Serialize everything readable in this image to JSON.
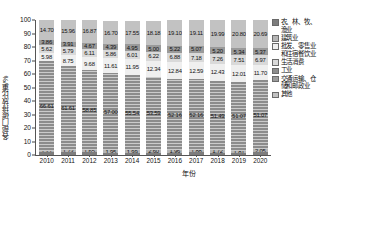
{
  "chart": {
    "type": "bar",
    "y_axis_title": "各部门碳排放比重/%",
    "x_axis_title": "年份",
    "y_ticks": [
      "0",
      "10",
      "20",
      "30",
      "40",
      "50",
      "60",
      "70",
      "80",
      "90",
      "100"
    ]
  },
  "legend": {
    "items": [
      {
        "label": "农、林、牧、\n渔业",
        "color": "#7d7d7d",
        "key": "agriculture"
      },
      {
        "label": "建筑业",
        "color": "#b5b5b5",
        "key": "construction"
      },
      {
        "label": "批发、零售业\n和住宿餐饮业",
        "color": "#efefef",
        "key": "wholesale"
      },
      {
        "label": "生活消费",
        "color": "#d9d9d9",
        "key": "living"
      },
      {
        "label": "工业",
        "color": "#8c8c8c",
        "key": "industry"
      },
      {
        "label": "交通运输、仓\n储和邮政业",
        "color": "#9a9a9a",
        "key": "transport"
      },
      {
        "label": "其他",
        "color": "#c2c2c2",
        "key": "other"
      }
    ]
  },
  "chart_data": {
    "type": "bar",
    "subtype": "stacked-bar-100",
    "title": "",
    "xlabel": "年份",
    "ylabel": "各部门碳排放比重/%",
    "ylim": [
      0,
      100
    ],
    "yticks": [
      0,
      10,
      20,
      30,
      40,
      50,
      60,
      70,
      80,
      90,
      100
    ],
    "grid": false,
    "legend_position": "right",
    "categories": [
      "2010",
      "2011",
      "2012",
      "2013",
      "2014",
      "2015",
      "2016",
      "2017",
      "2018",
      "2019",
      "2020"
    ],
    "series": [
      {
        "name": "农、林、牧、渔业",
        "color": "#7d7d7d",
        "values": [
          2.01,
          2.26,
          2.32,
          1.49,
          1.45,
          1.46,
          1.84,
          1.96,
          1.78,
          1.46,
          2.15
        ]
      },
      {
        "name": "建筑业",
        "color": "#b5b5b5",
        "values": [
          1.21,
          1.73,
          1.65,
          1.95,
          1.99,
          2.6,
          1.96,
          1.88,
          1.72,
          1.81,
          2.05
        ]
      },
      {
        "name": "工业",
        "color": "#8c8c8c",
        "values": [
          66.61,
          61.61,
          58.85,
          57.0,
          55.54,
          53.59,
          52.16,
          52.16,
          51.49,
          51.07,
          51.07
        ]
      },
      {
        "name": "批发、零售业和住宿餐饮业",
        "color": "#efefef",
        "values": [
          5.98,
          8.75,
          9.68,
          11.61,
          11.95,
          12.34,
          12.84,
          12.59,
          12.43,
          12.01,
          11.7
        ]
      },
      {
        "name": "生活消费",
        "color": "#d9d9d9",
        "values": [
          5.62,
          5.79,
          6.11,
          5.86,
          6.01,
          6.22,
          6.88,
          7.18,
          7.26,
          7.51,
          6.97
        ]
      },
      {
        "name": "交通运输、仓储和邮政业",
        "color": "#9a9a9a",
        "values": [
          3.86,
          3.91,
          4.67,
          4.39,
          4.95,
          5.0,
          5.22,
          5.07,
          5.2,
          5.34,
          5.37
        ]
      },
      {
        "name": "其他",
        "color": "#c2c2c2",
        "values": [
          14.7,
          15.96,
          16.87,
          16.7,
          17.55,
          18.18,
          19.1,
          19.11,
          19.99,
          20.8,
          20.69
        ]
      }
    ],
    "labeled_series_keys": [
      "其他",
      "交通运输、仓储和邮政业",
      "生活消费",
      "批发、零售业和住宿餐饮业",
      "建筑业",
      "工业"
    ]
  }
}
